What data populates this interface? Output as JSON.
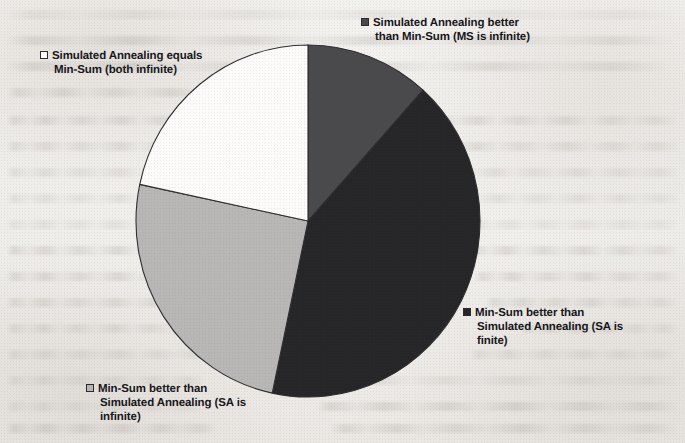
{
  "figure": {
    "background_color": "#f1efec",
    "type": "pie-chart",
    "pie": {
      "center_x": 308,
      "center_y": 221,
      "radius_x": 172,
      "radius_y": 176,
      "outline_color": "#2e2d2f"
    }
  },
  "chart_data": {
    "type": "pie",
    "title": "",
    "subtitle": "",
    "xlabel": "",
    "ylabel": "",
    "grid": false,
    "legend_position": "callout-labels-around-pie",
    "start_angle_deg": 0,
    "direction": "clockwise",
    "categories": [
      "Simulated Annealing better than Min-Sum (MS is infinite)",
      "Min-Sum better than Simulated Annealing (SA is finite)",
      "Min-Sum better than Simulated Annealing (SA is infinite)",
      "Simulated Annealing equals Min-Sum (both infinite)"
    ],
    "values": [
      11.7,
      41.7,
      25.0,
      21.6
    ],
    "unit": "percent",
    "slices": [
      {
        "label": "Simulated Annealing better than Min-Sum (MS is infinite)",
        "value": 11.7,
        "start_angle_deg": 0,
        "end_angle_deg": 42,
        "color": "#4a4a4c",
        "swatch_color": "#4a4a4c"
      },
      {
        "label": "Min-Sum better than Simulated Annealing (SA is finite)",
        "value": 41.7,
        "start_angle_deg": 42,
        "end_angle_deg": 192,
        "color": "#262528",
        "swatch_color": "#262528"
      },
      {
        "label": "Min-Sum better than Simulated Annealing (SA is infinite)",
        "value": 25.0,
        "start_angle_deg": 192,
        "end_angle_deg": 282,
        "color": "#b8b7b5",
        "swatch_color": "#b8b7b5"
      },
      {
        "label": "Simulated Annealing equals Min-Sum (both infinite)",
        "value": 21.6,
        "start_angle_deg": 282,
        "end_angle_deg": 360,
        "color": "#fcfbf9",
        "swatch_color": "#fcfbf9"
      }
    ]
  },
  "labels": {
    "sa_better": {
      "text": "Simulated Annealing better\nthan Min-Sum (MS is infinite)",
      "swatch_color": "#4a4a4c"
    },
    "sa_equals": {
      "text": "Simulated Annealing equals\nMin-Sum (both infinite)",
      "swatch_color": "#fcfbf9"
    },
    "ms_better_finite": {
      "text": "Min-Sum better than\nSimulated Annealing (SA is\nfinite)",
      "swatch_color": "#262528"
    },
    "ms_better_infinite": {
      "text": "Min-Sum better than\nSimulated Annealing (SA is\ninfinite)",
      "swatch_color": "#b8b7b5"
    }
  }
}
